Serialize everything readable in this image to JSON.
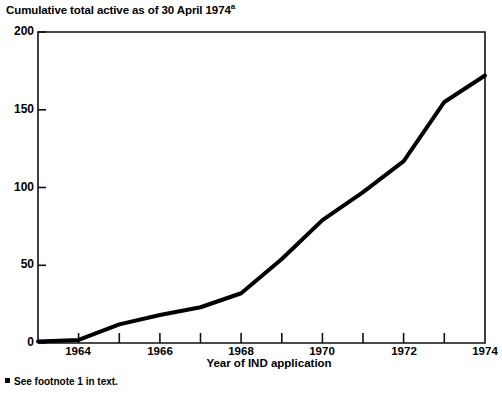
{
  "figure": {
    "title": "Cumulative total active as of 30 April 1974",
    "title_superscript": "a",
    "footnote_marker": "▪",
    "footnote": "See footnote 1 in text."
  },
  "chart_data": {
    "type": "line",
    "title": "Cumulative total active as of 30 April 1974",
    "xlabel": "Year of IND application",
    "ylabel": "",
    "xlim": [
      1963.0,
      1974.0
    ],
    "ylim": [
      0,
      200
    ],
    "grid": false,
    "legend": null,
    "line_color": "#000000",
    "line_width": 4,
    "y_ticks": [
      0,
      50,
      100,
      150,
      200
    ],
    "y_tick_labels": [
      "0",
      "50",
      "100",
      "150",
      "200"
    ],
    "y_minor_ticks": [
      25,
      75,
      125,
      175
    ],
    "x_ticks": [
      1964,
      1965,
      1966,
      1967,
      1968,
      1969,
      1970,
      1971,
      1972,
      1973,
      1974
    ],
    "x_tick_labels": [
      "1964",
      "",
      "1966",
      "",
      "1968",
      "",
      "1970",
      "",
      "1972",
      "",
      "1974"
    ],
    "x_labeled_ticks": [
      1964,
      1966,
      1968,
      1970,
      1972,
      1974
    ],
    "x": [
      1963.0,
      1964.0,
      1965.0,
      1966.0,
      1967.0,
      1968.0,
      1969.0,
      1970.0,
      1971.0,
      1972.0,
      1973.0,
      1974.0
    ],
    "values": [
      1,
      2,
      12,
      18,
      23,
      32,
      54,
      79,
      97,
      117,
      155,
      172
    ],
    "series": [
      {
        "name": "Cumulative total active INDs",
        "x": [
          1963.0,
          1964.0,
          1965.0,
          1966.0,
          1967.0,
          1968.0,
          1969.0,
          1970.0,
          1971.0,
          1972.0,
          1973.0,
          1974.0
        ],
        "values": [
          1,
          2,
          12,
          18,
          23,
          32,
          54,
          79,
          97,
          117,
          155,
          172
        ]
      }
    ]
  }
}
